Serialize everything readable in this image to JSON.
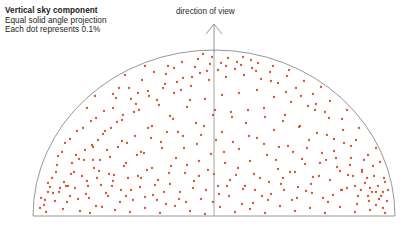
{
  "figure": {
    "caption": {
      "line1": "Vertical sky component",
      "line2": "Equal solid angle projection",
      "line3": "Each dot represents 0.1%"
    },
    "direction_label": "direction of view",
    "arrow_icon": "up-arrow-icon"
  },
  "chart_data": {
    "type": "scatter",
    "title": "Vertical sky component",
    "subtitle": "Equal solid angle projection",
    "annotation": "Each dot represents 0.1%",
    "axis_annotation": "direction of view",
    "grid": false,
    "legend": false,
    "xlabel": "",
    "ylabel": "",
    "projection": "equal solid angle (hemispherical dome)",
    "dot_value_percent": 0.1,
    "dot_color": "#d9502a",
    "outline_color": "#8a8a8a",
    "dome": {
      "cx": 214,
      "cy": 216,
      "rx": 181,
      "ry": 166,
      "baseline_y": 216
    },
    "center_line": {
      "x": 214,
      "y_top": 50,
      "y_bottom": 216
    },
    "arrow": {
      "x": 214,
      "y_tip": 24,
      "y_base": 50
    },
    "point_count": 372,
    "points": [
      [
        60,
        188
      ],
      [
        71,
        174
      ],
      [
        78,
        199
      ],
      [
        84,
        160
      ],
      [
        88,
        186
      ],
      [
        93,
        147
      ],
      [
        96,
        206
      ],
      [
        99,
        171
      ],
      [
        103,
        134
      ],
      [
        106,
        193
      ],
      [
        110,
        157
      ],
      [
        113,
        181
      ],
      [
        117,
        122
      ],
      [
        120,
        202
      ],
      [
        124,
        166
      ],
      [
        127,
        143
      ],
      [
        131,
        190
      ],
      [
        134,
        112
      ],
      [
        138,
        176
      ],
      [
        141,
        152
      ],
      [
        145,
        197
      ],
      [
        148,
        128
      ],
      [
        152,
        168
      ],
      [
        155,
        185
      ],
      [
        159,
        105
      ],
      [
        162,
        148
      ],
      [
        166,
        204
      ],
      [
        169,
        173
      ],
      [
        173,
        119
      ],
      [
        176,
        158
      ],
      [
        180,
        192
      ],
      [
        183,
        136
      ],
      [
        187,
        165
      ],
      [
        190,
        100
      ],
      [
        194,
        181
      ],
      [
        197,
        144
      ],
      [
        201,
        199
      ],
      [
        204,
        126
      ],
      [
        208,
        170
      ],
      [
        211,
        154
      ],
      [
        215,
        110
      ],
      [
        218,
        186
      ],
      [
        222,
        132
      ],
      [
        225,
        163
      ],
      [
        229,
        196
      ],
      [
        232,
        117
      ],
      [
        236,
        175
      ],
      [
        239,
        149
      ],
      [
        243,
        189
      ],
      [
        246,
        123
      ],
      [
        250,
        161
      ],
      [
        253,
        203
      ],
      [
        257,
        138
      ],
      [
        260,
        178
      ],
      [
        264,
        108
      ],
      [
        267,
        155
      ],
      [
        271,
        194
      ],
      [
        274,
        130
      ],
      [
        278,
        169
      ],
      [
        281,
        184
      ],
      [
        285,
        115
      ],
      [
        288,
        146
      ],
      [
        292,
        200
      ],
      [
        295,
        172
      ],
      [
        299,
        127
      ],
      [
        302,
        159
      ],
      [
        306,
        191
      ],
      [
        309,
        140
      ],
      [
        313,
        177
      ],
      [
        316,
        104
      ],
      [
        320,
        163
      ],
      [
        323,
        198
      ],
      [
        327,
        135
      ],
      [
        330,
        180
      ],
      [
        334,
        151
      ],
      [
        337,
        167
      ],
      [
        341,
        190
      ],
      [
        344,
        143
      ],
      [
        348,
        175
      ],
      [
        351,
        158
      ],
      [
        355,
        186
      ],
      [
        358,
        196
      ],
      [
        362,
        170
      ],
      [
        365,
        183
      ],
      [
        369,
        201
      ],
      [
        372,
        192
      ],
      [
        376,
        205
      ],
      [
        379,
        199
      ],
      [
        383,
        208
      ],
      [
        55,
        201
      ],
      [
        63,
        209
      ],
      [
        70,
        196
      ],
      [
        80,
        211
      ],
      [
        90,
        213
      ],
      [
        102,
        207
      ],
      [
        115,
        210
      ],
      [
        130,
        212
      ],
      [
        145,
        208
      ],
      [
        160,
        213
      ],
      [
        175,
        206
      ],
      [
        190,
        211
      ],
      [
        205,
        214
      ],
      [
        220,
        207
      ],
      [
        235,
        212
      ],
      [
        250,
        209
      ],
      [
        265,
        213
      ],
      [
        280,
        206
      ],
      [
        295,
        211
      ],
      [
        310,
        208
      ],
      [
        325,
        213
      ],
      [
        340,
        207
      ],
      [
        355,
        212
      ],
      [
        370,
        210
      ],
      [
        385,
        213
      ],
      [
        48,
        192
      ],
      [
        52,
        178
      ],
      [
        57,
        165
      ],
      [
        62,
        152
      ],
      [
        66,
        186
      ],
      [
        70,
        139
      ],
      [
        74,
        172
      ],
      [
        79,
        159
      ],
      [
        83,
        128
      ],
      [
        87,
        181
      ],
      [
        92,
        145
      ],
      [
        96,
        118
      ],
      [
        100,
        160
      ],
      [
        105,
        131
      ],
      [
        109,
        174
      ],
      [
        113,
        108
      ],
      [
        118,
        147
      ],
      [
        122,
        120
      ],
      [
        126,
        163
      ],
      [
        131,
        99
      ],
      [
        135,
        136
      ],
      [
        139,
        110
      ],
      [
        144,
        153
      ],
      [
        148,
        91
      ],
      [
        152,
        126
      ],
      [
        157,
        100
      ],
      [
        161,
        142
      ],
      [
        165,
        84
      ],
      [
        170,
        116
      ],
      [
        174,
        93
      ],
      [
        178,
        132
      ],
      [
        183,
        78
      ],
      [
        187,
        107
      ],
      [
        191,
        86
      ],
      [
        196,
        123
      ],
      [
        200,
        73
      ],
      [
        205,
        99
      ],
      [
        209,
        80
      ],
      [
        213,
        115
      ],
      [
        218,
        70
      ],
      [
        222,
        95
      ],
      [
        226,
        77
      ],
      [
        231,
        112
      ],
      [
        235,
        69
      ],
      [
        239,
        93
      ],
      [
        244,
        75
      ],
      [
        248,
        110
      ],
      [
        252,
        68
      ],
      [
        257,
        90
      ],
      [
        261,
        79
      ],
      [
        265,
        117
      ],
      [
        270,
        72
      ],
      [
        274,
        97
      ],
      [
        278,
        83
      ],
      [
        283,
        121
      ],
      [
        287,
        76
      ],
      [
        291,
        102
      ],
      [
        296,
        88
      ],
      [
        300,
        126
      ],
      [
        304,
        81
      ],
      [
        308,
        106
      ],
      [
        313,
        94
      ],
      [
        317,
        133
      ],
      [
        321,
        87
      ],
      [
        325,
        112
      ],
      [
        330,
        101
      ],
      [
        334,
        139
      ],
      [
        338,
        95
      ],
      [
        342,
        119
      ],
      [
        347,
        110
      ],
      [
        351,
        146
      ],
      [
        355,
        104
      ],
      [
        359,
        128
      ],
      [
        364,
        121
      ],
      [
        368,
        155
      ],
      [
        372,
        133
      ],
      [
        376,
        148
      ],
      [
        380,
        162
      ],
      [
        384,
        178
      ],
      [
        388,
        190
      ],
      [
        44,
        205
      ],
      [
        50,
        187
      ],
      [
        58,
        156
      ],
      [
        65,
        143
      ],
      [
        72,
        163
      ],
      [
        77,
        131
      ],
      [
        85,
        150
      ],
      [
        91,
        121
      ],
      [
        98,
        140
      ],
      [
        104,
        111
      ],
      [
        111,
        128
      ],
      [
        116,
        98
      ],
      [
        123,
        115
      ],
      [
        129,
        88
      ],
      [
        136,
        104
      ],
      [
        142,
        80
      ],
      [
        149,
        96
      ],
      [
        154,
        72
      ],
      [
        163,
        88
      ],
      [
        168,
        66
      ],
      [
        177,
        82
      ],
      [
        182,
        62
      ],
      [
        192,
        77
      ],
      [
        198,
        59
      ],
      [
        207,
        71
      ],
      [
        212,
        57
      ],
      [
        221,
        63
      ],
      [
        228,
        58
      ],
      [
        237,
        62
      ],
      [
        243,
        57
      ],
      [
        251,
        60
      ],
      [
        258,
        63
      ],
      [
        266,
        58
      ],
      [
        273,
        66
      ],
      [
        280,
        61
      ],
      [
        289,
        70
      ],
      [
        294,
        65
      ],
      [
        303,
        74
      ],
      [
        310,
        69
      ],
      [
        318,
        79
      ],
      [
        324,
        73
      ],
      [
        332,
        86
      ],
      [
        339,
        80
      ],
      [
        346,
        93
      ],
      [
        352,
        87
      ],
      [
        360,
        101
      ],
      [
        366,
        113
      ],
      [
        371,
        124
      ],
      [
        377,
        138
      ],
      [
        382,
        152
      ],
      [
        386,
        168
      ],
      [
        390,
        183
      ],
      [
        41,
        198
      ],
      [
        46,
        212
      ],
      [
        53,
        193
      ],
      [
        67,
        202
      ],
      [
        75,
        188
      ],
      [
        82,
        176
      ],
      [
        89,
        198
      ],
      [
        94,
        168
      ],
      [
        101,
        185
      ],
      [
        108,
        196
      ],
      [
        114,
        175
      ],
      [
        121,
        190
      ],
      [
        128,
        178
      ],
      [
        133,
        200
      ],
      [
        140,
        187
      ],
      [
        147,
        170
      ],
      [
        153,
        195
      ],
      [
        158,
        180
      ],
      [
        164,
        192
      ],
      [
        171,
        166
      ],
      [
        179,
        199
      ],
      [
        185,
        173
      ],
      [
        193,
        188
      ],
      [
        199,
        161
      ],
      [
        206,
        190
      ],
      [
        214,
        174
      ],
      [
        219,
        194
      ],
      [
        224,
        152
      ],
      [
        230,
        180
      ],
      [
        238,
        168
      ],
      [
        245,
        186
      ],
      [
        254,
        174
      ],
      [
        262,
        196
      ],
      [
        269,
        182
      ],
      [
        276,
        160
      ],
      [
        284,
        190
      ],
      [
        290,
        172
      ],
      [
        298,
        187
      ],
      [
        305,
        164
      ],
      [
        312,
        193
      ],
      [
        319,
        176
      ],
      [
        326,
        160
      ],
      [
        333,
        195
      ],
      [
        340,
        171
      ],
      [
        347,
        188
      ],
      [
        353,
        176
      ],
      [
        361,
        190
      ],
      [
        367,
        178
      ],
      [
        373,
        166
      ],
      [
        378,
        186
      ],
      [
        383,
        192
      ],
      [
        387,
        201
      ],
      [
        391,
        196
      ],
      [
        119,
        88
      ],
      [
        125,
        75
      ],
      [
        145,
        66
      ],
      [
        156,
        60
      ],
      [
        172,
        55
      ],
      [
        188,
        52
      ],
      [
        203,
        54
      ],
      [
        217,
        51
      ],
      [
        232,
        53
      ],
      [
        247,
        52
      ],
      [
        262,
        54
      ],
      [
        277,
        57
      ],
      [
        292,
        60
      ],
      [
        306,
        64
      ],
      [
        320,
        68
      ],
      [
        334,
        75
      ],
      [
        345,
        83
      ],
      [
        358,
        95
      ],
      [
        369,
        106
      ],
      [
        379,
        122
      ],
      [
        385,
        140
      ],
      [
        389,
        158
      ],
      [
        392,
        175
      ],
      [
        394,
        192
      ],
      [
        87,
        108
      ],
      [
        95,
        96
      ],
      [
        104,
        86
      ],
      [
        113,
        94
      ],
      [
        132,
        70
      ],
      [
        138,
        93
      ],
      [
        166,
        74
      ],
      [
        174,
        68
      ],
      [
        181,
        90
      ],
      [
        195,
        67
      ],
      [
        210,
        64
      ],
      [
        226,
        66
      ],
      [
        241,
        65
      ],
      [
        256,
        71
      ],
      [
        271,
        81
      ],
      [
        286,
        92
      ],
      [
        301,
        96
      ],
      [
        315,
        110
      ],
      [
        329,
        118
      ],
      [
        343,
        130
      ],
      [
        356,
        140
      ],
      [
        364,
        160
      ],
      [
        374,
        176
      ],
      [
        381,
        196
      ],
      [
        385,
        182
      ],
      [
        48,
        183
      ],
      [
        56,
        172
      ],
      [
        64,
        182
      ],
      [
        76,
        155
      ],
      [
        93,
        160
      ],
      [
        107,
        150
      ],
      [
        122,
        141
      ],
      [
        137,
        155
      ],
      [
        151,
        138
      ],
      [
        167,
        132
      ],
      [
        184,
        148
      ],
      [
        201,
        135
      ],
      [
        216,
        140
      ],
      [
        233,
        142
      ],
      [
        249,
        136
      ],
      [
        264,
        144
      ],
      [
        279,
        147
      ],
      [
        293,
        152
      ],
      [
        307,
        148
      ],
      [
        322,
        153
      ],
      [
        336,
        158
      ],
      [
        350,
        165
      ],
      [
        362,
        172
      ],
      [
        370,
        188
      ],
      [
        376,
        192
      ],
      [
        40,
        208
      ],
      [
        45,
        200
      ],
      [
        59,
        192
      ],
      [
        68,
        186
      ],
      [
        86,
        194
      ],
      [
        97,
        178
      ],
      [
        112,
        186
      ],
      [
        126,
        196
      ],
      [
        141,
        178
      ],
      [
        157,
        200
      ],
      [
        170,
        184
      ],
      [
        186,
        202
      ],
      [
        199,
        176
      ],
      [
        213,
        202
      ],
      [
        227,
        186
      ],
      [
        242,
        204
      ],
      [
        255,
        190
      ],
      [
        268,
        200
      ],
      [
        283,
        178
      ],
      [
        297,
        198
      ],
      [
        311,
        184
      ],
      [
        328,
        202
      ],
      [
        342,
        190
      ],
      [
        357,
        204
      ],
      [
        368,
        196
      ]
    ]
  }
}
